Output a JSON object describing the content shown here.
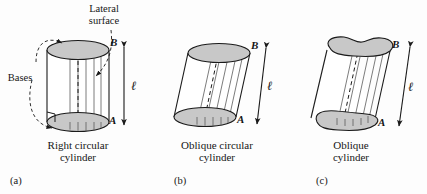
{
  "figure": {
    "background_color": "#fdfdfd",
    "stroke_color": "#1a1a1a",
    "base_fill_color": "#c8c8c8",
    "ruling_color": "#555555"
  },
  "annotations": {
    "lateral_surface_line1": "Lateral",
    "lateral_surface_line2": "surface",
    "bases": "Bases"
  },
  "panels": [
    {
      "id": "(a)",
      "caption_line1": "Right circular",
      "caption_line2": "cylinder",
      "top_point": "B",
      "bottom_point": "A",
      "height_symbol": "ℓ",
      "base_shape": "ellipse",
      "orientation": "right",
      "has_right_angle_marker": true
    },
    {
      "id": "(b)",
      "caption_line1": "Oblique circular",
      "caption_line2": "cylinder",
      "top_point": "B",
      "bottom_point": "A",
      "height_symbol": "ℓ",
      "base_shape": "ellipse",
      "orientation": "oblique",
      "has_right_angle_marker": false
    },
    {
      "id": "(c)",
      "caption_line1": "Oblique",
      "caption_line2": "cylinder",
      "top_point": "B",
      "bottom_point": "A",
      "height_symbol": "ℓ",
      "base_shape": "irregular-blob",
      "orientation": "oblique",
      "has_right_angle_marker": false
    }
  ]
}
